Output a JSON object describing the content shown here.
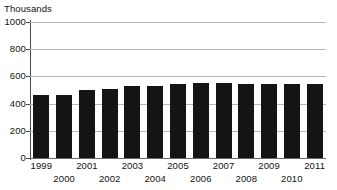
{
  "chart_data": {
    "type": "bar",
    "title": "",
    "subtitle": "",
    "units_label": "Thousands",
    "xlabel": "",
    "ylabel": "",
    "ylim": [
      0,
      1000
    ],
    "ytick_step": 200,
    "grid": true,
    "legend": false,
    "legend_position": "none",
    "bar_color": "#141414",
    "gridline_color": "#b8b8b8",
    "axis_color": "#4a4a4a",
    "categories": [
      "1999",
      "2000",
      "2001",
      "2002",
      "2003",
      "2004",
      "2005",
      "2006",
      "2007",
      "2008",
      "2009",
      "2010",
      "2011"
    ],
    "values": [
      465,
      462,
      500,
      505,
      527,
      530,
      543,
      548,
      550,
      545,
      545,
      543,
      545
    ],
    "ytick_labels": [
      "1000",
      "800",
      "600",
      "400",
      "200",
      "0"
    ],
    "ytick_values": [
      1000,
      800,
      600,
      400,
      200,
      0
    ],
    "xtick_rows": [
      {
        "row": "top",
        "labels": [
          "1999",
          "2001",
          "2003",
          "2005",
          "2007",
          "2009",
          "2011"
        ]
      },
      {
        "row": "bottom",
        "labels": [
          "2000",
          "2002",
          "2004",
          "2006",
          "2008",
          "2010"
        ]
      }
    ]
  }
}
